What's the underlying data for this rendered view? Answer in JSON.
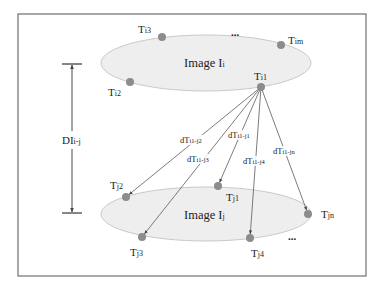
{
  "diagram": {
    "colors": {
      "frame": "#6e6e6e",
      "ellipse_fill": "#eeeeee",
      "ellipse_stroke": "#c9c9c9",
      "node": "#8c8c8c",
      "edge": "#5a5a5a",
      "text": "#222222"
    },
    "frame": {
      "x": 18,
      "y": 14,
      "w": 348,
      "h": 262
    },
    "image_i": {
      "label_main": "Image I",
      "label_sub": "i",
      "cx": 206,
      "cy": 63,
      "rx": 105,
      "ry": 28,
      "label_x": 184,
      "label_y": 67,
      "dots": {
        "text": "...",
        "x": 231,
        "y": 36
      },
      "nodes": [
        {
          "id": "Ti1",
          "main": "T",
          "sub": "i1",
          "x": 261,
          "y": 87,
          "lx": 254,
          "ly": 80
        },
        {
          "id": "Ti2",
          "main": "T",
          "sub": "i2",
          "x": 130,
          "y": 82,
          "lx": 108,
          "ly": 96
        },
        {
          "id": "Ti3",
          "main": "T",
          "sub": "i3",
          "x": 162,
          "y": 37,
          "lx": 138,
          "ly": 33
        },
        {
          "id": "Tim",
          "main": "T",
          "sub": "im",
          "x": 281,
          "y": 45,
          "lx": 288,
          "ly": 44
        }
      ]
    },
    "image_j": {
      "label_main": "Image I",
      "label_sub": "j",
      "cx": 206,
      "cy": 214,
      "rx": 105,
      "ry": 27,
      "label_x": 184,
      "label_y": 219,
      "dots": {
        "text": "...",
        "x": 288,
        "y": 240
      },
      "nodes": [
        {
          "id": "Tj1",
          "main": "T",
          "sub": "j1",
          "x": 218,
          "y": 186,
          "lx": 226,
          "ly": 201
        },
        {
          "id": "Tj2",
          "main": "T",
          "sub": "j2",
          "x": 126,
          "y": 197,
          "lx": 110,
          "ly": 189
        },
        {
          "id": "Tj3",
          "main": "T",
          "sub": "j3",
          "x": 142,
          "y": 237,
          "lx": 130,
          "ly": 256
        },
        {
          "id": "Tj4",
          "main": "T",
          "sub": "j4",
          "x": 250,
          "y": 238,
          "lx": 251,
          "ly": 257
        },
        {
          "id": "Tjn",
          "main": "T",
          "sub": "jn",
          "x": 308,
          "y": 214,
          "lx": 321,
          "ly": 218
        }
      ]
    },
    "edges": [
      {
        "from": "Ti1",
        "to": "Tj2",
        "main": "dT",
        "sub": "i1-j2",
        "lx": 180,
        "ly": 143
      },
      {
        "from": "Ti1",
        "to": "Tj3",
        "main": "dT",
        "sub": "i1-j3",
        "lx": 187,
        "ly": 162
      },
      {
        "from": "Ti1",
        "to": "Tj1",
        "main": "dT",
        "sub": "i1-j1",
        "lx": 228,
        "ly": 138
      },
      {
        "from": "Ti1",
        "to": "Tj4",
        "main": "dT",
        "sub": "i1-j4",
        "lx": 243,
        "ly": 164
      },
      {
        "from": "Ti1",
        "to": "Tjn",
        "main": "dT",
        "sub": "i1-jn",
        "lx": 273,
        "ly": 154
      }
    ],
    "distance": {
      "main": "DI",
      "sub": "i-j",
      "x": 72,
      "y_top": 64,
      "y_bottom": 213,
      "bar_half": 10,
      "label_x": 62,
      "label_y": 144
    }
  }
}
